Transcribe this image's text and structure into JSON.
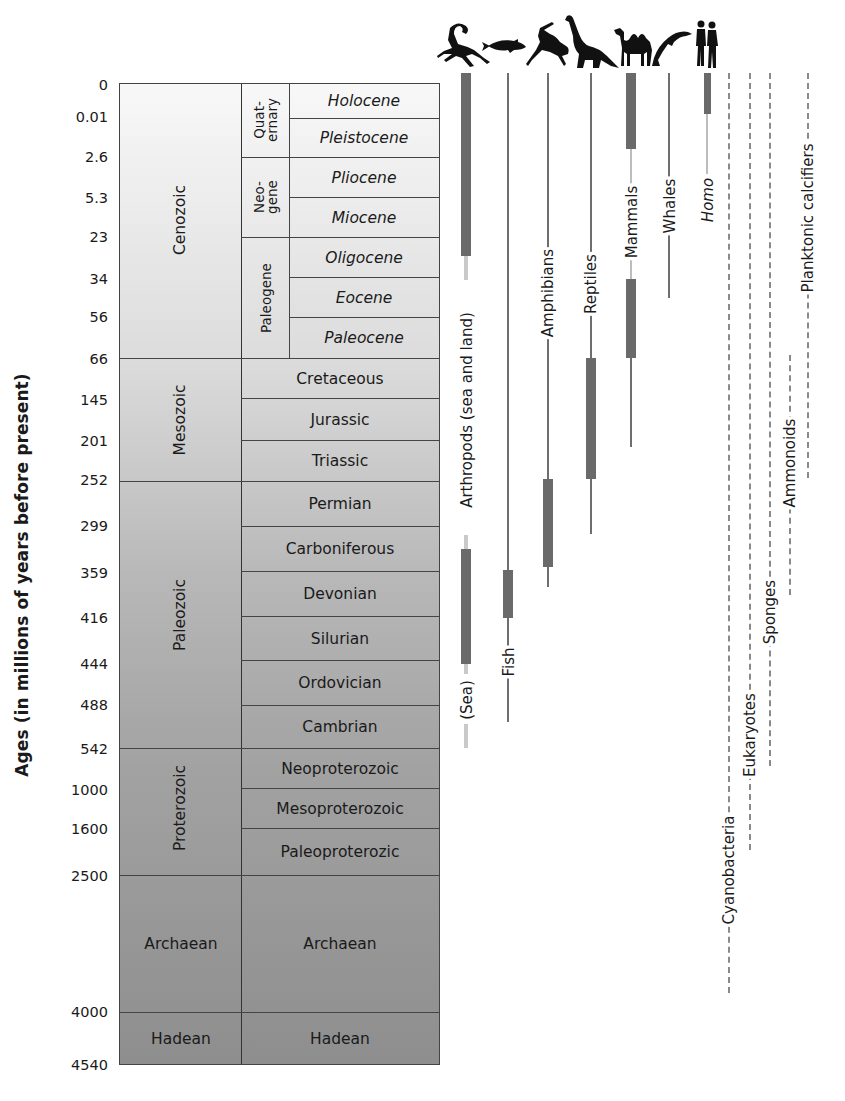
{
  "axis": {
    "title": "Ages (in millions of years before present)",
    "ticks": [
      "0",
      "0.01",
      "2.6",
      "5.3",
      "23",
      "34",
      "56",
      "66",
      "145",
      "201",
      "252",
      "299",
      "359",
      "416",
      "444",
      "488",
      "542",
      "1000",
      "1600",
      "2500",
      "4000",
      "4540"
    ]
  },
  "eons_eras": [
    {
      "name": "Cenozoic",
      "from": "0",
      "to": "66"
    },
    {
      "name": "Mesozoic",
      "from": "66",
      "to": "252"
    },
    {
      "name": "Paleozoic",
      "from": "252",
      "to": "542"
    },
    {
      "name": "Proterozoic",
      "from": "542",
      "to": "2500"
    },
    {
      "name": "Archaean",
      "from": "2500",
      "to": "4000"
    },
    {
      "name": "Hadean",
      "from": "4000",
      "to": "4540"
    }
  ],
  "cenozoic_periods": [
    {
      "name": "Quat-\nernary",
      "line1": "Quat-",
      "line2": "ernary"
    },
    {
      "name": "Neo-\ngene",
      "line1": "Neo-",
      "line2": "gene"
    },
    {
      "name": "Paleogene"
    }
  ],
  "subdivisions": [
    "Holocene",
    "Pleistocene",
    "Pliocene",
    "Miocene",
    "Oligocene",
    "Eocene",
    "Paleocene",
    "Cretaceous",
    "Jurassic",
    "Triassic",
    "Permian",
    "Carboniferous",
    "Devonian",
    "Silurian",
    "Ordovician",
    "Cambrian",
    "Neoproterozoic",
    "Mesoproterozoic",
    "Paleoproterozic",
    "Archaean",
    "Hadean"
  ],
  "lineages": [
    {
      "name": "Arthropods (sea and land)",
      "sub_label": "(Sea)",
      "icon": "scorpion-icon"
    },
    {
      "name": "Fish",
      "icon": "fish-icon"
    },
    {
      "name": "Amphibians",
      "icon": "frog-icon"
    },
    {
      "name": "Reptiles",
      "icon": "dinosaur-icon"
    },
    {
      "name": "Mammals",
      "icon": "camel-icon"
    },
    {
      "name": "Whales",
      "icon": "dolphin-icon"
    },
    {
      "name": "Homo",
      "icon": "humans-icon"
    },
    {
      "name": "Cyanobacteria"
    },
    {
      "name": "Eukaryotes"
    },
    {
      "name": "Sponges"
    },
    {
      "name": "Ammonoids"
    },
    {
      "name": "Planktonic calcifiers"
    }
  ],
  "colors": {
    "table_top": "#f7f7f7",
    "table_bottom": "#8c8c8c",
    "bar": "#6a6a6a",
    "line": "#6e6e6e",
    "faint": "#c9c9c9",
    "dash": "#8a8a8a"
  }
}
